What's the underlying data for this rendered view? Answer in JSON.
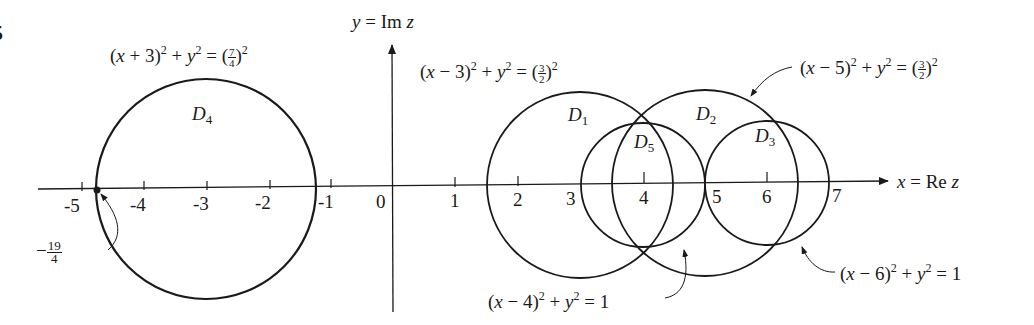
{
  "figure": {
    "problem_marker": "5",
    "axes": {
      "x_label": "x = Re z",
      "y_label": "y = Im z",
      "x_ticks": [
        "-5",
        "-4",
        "-3",
        "-2",
        "-1",
        "0",
        "1",
        "2",
        "3",
        "4",
        "5",
        "6",
        "7"
      ],
      "point_label": {
        "sign": "−",
        "num": "19",
        "den": "4",
        "value": -4.75
      }
    },
    "regions": [
      {
        "name": "D1",
        "letter": "D",
        "sub": "1",
        "center": [
          3,
          0
        ],
        "radius": 1.5,
        "equation": {
          "lhs": "(x − 3)",
          "rhs_num": "3",
          "rhs_den": "2"
        }
      },
      {
        "name": "D2",
        "letter": "D",
        "sub": "2",
        "center": [
          5,
          0
        ],
        "radius": 1.5,
        "equation": {
          "lhs": "(x − 5)",
          "rhs_num": "3",
          "rhs_den": "2"
        }
      },
      {
        "name": "D3",
        "letter": "D",
        "sub": "3",
        "center": [
          6,
          0
        ],
        "radius": 1,
        "equation": {
          "lhs": "(x − 6)",
          "rhs": "1"
        }
      },
      {
        "name": "D4",
        "letter": "D",
        "sub": "4",
        "center": [
          -3,
          0
        ],
        "radius": 1.75,
        "equation": {
          "lhs": "(x + 3)",
          "rhs_num": "7",
          "rhs_den": "4"
        }
      },
      {
        "name": "D5",
        "letter": "D",
        "sub": "5",
        "center": [
          4,
          0
        ],
        "radius": 1,
        "equation": {
          "lhs": "(x − 4)",
          "rhs": "1"
        }
      }
    ],
    "eq_common": {
      "plus_y2": " + y",
      "equals": " = ",
      "sq": "2"
    }
  }
}
